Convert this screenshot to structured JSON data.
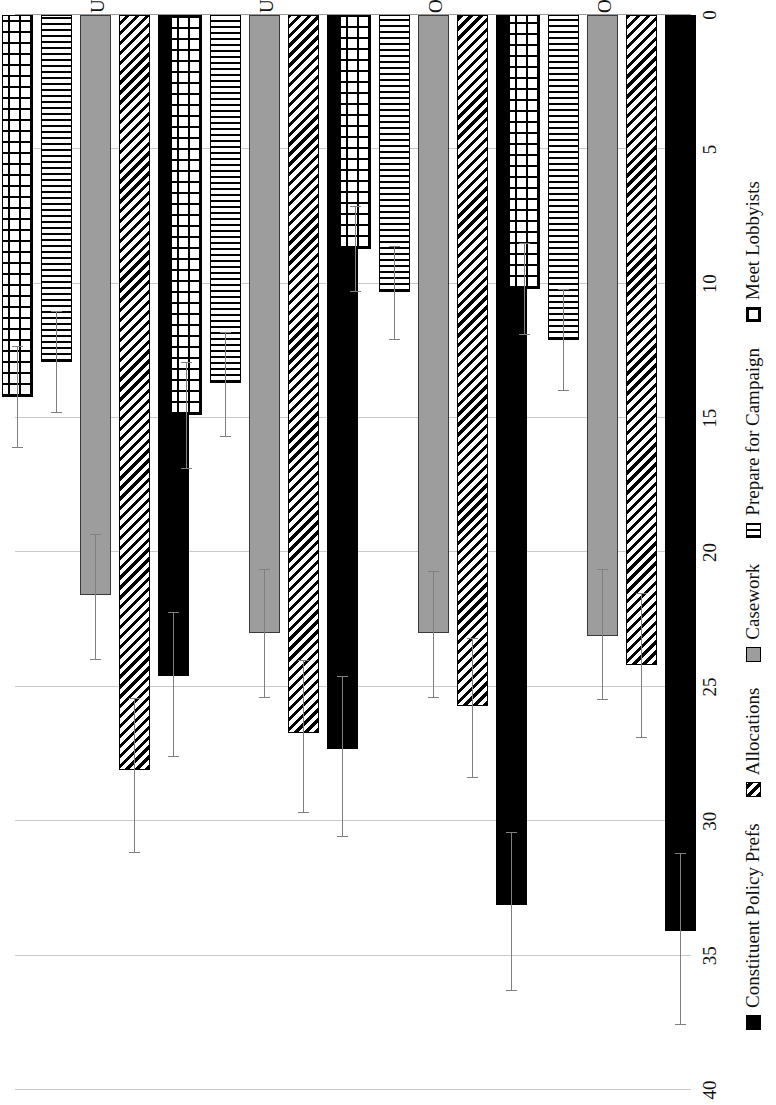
{
  "chart_data": {
    "type": "bar",
    "orientation": "horizontal-grouped-rotated",
    "title": "",
    "subtitle": "",
    "xlabel": "",
    "ylabel": "",
    "categories": [
      "Under $30k",
      "Under $50k",
      "Over $100k",
      "Over $200k"
    ],
    "series": [
      {
        "name": "Constituent Policy Prefs",
        "pattern": "solid-black",
        "color": "#000000",
        "values": [
          24.6,
          27.3,
          33.1,
          34.1
        ],
        "error_low": [
          22.2,
          24.6,
          30.4,
          31.2
        ],
        "error_high": [
          27.6,
          30.6,
          36.3,
          37.6
        ]
      },
      {
        "name": "Allocations",
        "pattern": "diagonal-hatch",
        "color": "#000000",
        "values": [
          28.1,
          26.7,
          25.7,
          24.2
        ],
        "error_low": [
          25.4,
          24.0,
          23.2,
          21.5
        ],
        "error_high": [
          31.2,
          29.7,
          28.4,
          26.9
        ]
      },
      {
        "name": "Casework",
        "pattern": "solid-gray",
        "color": "#9d9d9d",
        "values": [
          21.6,
          23.0,
          23.0,
          23.1
        ],
        "error_low": [
          19.3,
          20.6,
          20.7,
          20.6
        ],
        "error_high": [
          24.0,
          25.4,
          25.4,
          25.5
        ]
      },
      {
        "name": "Prepare for Campaign",
        "pattern": "vertical-lines",
        "color": "#000000",
        "values": [
          12.9,
          13.7,
          10.3,
          12.1
        ],
        "error_low": [
          11.0,
          11.8,
          8.6,
          10.2
        ],
        "error_high": [
          14.8,
          15.7,
          12.1,
          14.0
        ]
      },
      {
        "name": "Meet Lobbyists",
        "pattern": "crosshatch",
        "color": "#000000",
        "values": [
          14.2,
          14.9,
          8.7,
          10.2
        ],
        "error_low": [
          12.3,
          12.9,
          7.1,
          8.5
        ],
        "error_high": [
          16.1,
          16.9,
          10.3,
          11.9
        ]
      }
    ],
    "value_axis": {
      "ticks": [
        40,
        35,
        30,
        25,
        20,
        15,
        10,
        5,
        0
      ],
      "min": 0,
      "max": 40,
      "reversed": true,
      "grid": true
    },
    "legend": {
      "position": "bottom",
      "entries": [
        "Constituent Policy Prefs",
        "Allocations",
        "Casework",
        "Prepare for Campaign",
        "Meet Lobbyists"
      ]
    }
  }
}
